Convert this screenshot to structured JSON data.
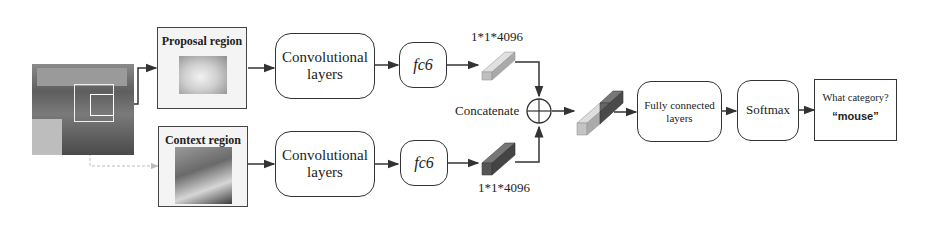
{
  "diagram": {
    "input_image": {
      "label": "input-scene-image"
    },
    "proposal_region": {
      "title": "Proposal region"
    },
    "context_region": {
      "title": "Context region"
    },
    "conv_top": {
      "line1": "Convolutional",
      "line2": "layers"
    },
    "conv_bottom": {
      "line1": "Convolutional",
      "line2": "layers"
    },
    "fc6_top": {
      "label": "fc6"
    },
    "fc6_bottom": {
      "label": "fc6"
    },
    "feature_top": {
      "dims": "1*1*4096"
    },
    "feature_bottom": {
      "dims": "1*1*4096"
    },
    "concat": {
      "label": "Concatenate"
    },
    "fully_connected": {
      "line1": "Fully connected",
      "line2": "layers"
    },
    "softmax": {
      "label": "Softmax"
    },
    "output": {
      "question": "What category?",
      "answer": "“mouse”"
    }
  },
  "colors": {
    "line": "#333333",
    "feature_light": "#c9c9c9",
    "feature_dark": "#555555",
    "photo_bg": "#6f6f6f"
  }
}
